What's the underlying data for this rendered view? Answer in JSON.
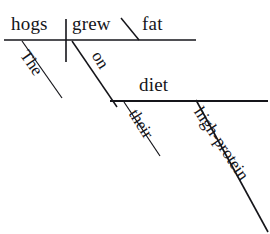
{
  "diagram": {
    "type": "reed-kellogg-sentence-diagram",
    "sentence": "The hogs grew fat on their high-protein diet.",
    "ink_color": "#15151a",
    "canvas": {
      "width": 270,
      "height": 234
    },
    "words": {
      "subject": "hogs",
      "verb": "grew",
      "predicate_adjective": "fat",
      "article": "The",
      "preposition": "on",
      "possessive": "their",
      "adjective": "high-protein",
      "object_of_preposition": "diet"
    },
    "lines": {
      "main_baseline": {
        "x1": 4,
        "y1": 40,
        "x2": 196,
        "y2": 40
      },
      "subject_verb_divider": {
        "x1": 66,
        "y1": 19,
        "x2": 66,
        "y2": 62
      },
      "predicate_adjective_slant": {
        "x1": 121,
        "y1": 18,
        "x2": 139,
        "y2": 40
      },
      "article_slant": {
        "x1": 22,
        "y1": 41,
        "x2": 62,
        "y2": 98
      },
      "preposition_slant": {
        "x1": 72,
        "y1": 41,
        "x2": 117,
        "y2": 107
      },
      "prep_object_baseline": {
        "x1": 110,
        "y1": 101,
        "x2": 268,
        "y2": 101
      },
      "possessive_slant": {
        "x1": 124,
        "y1": 102,
        "x2": 160,
        "y2": 156
      },
      "adjective_slant": {
        "x1": 196,
        "y1": 100,
        "x2": 268,
        "y2": 232
      }
    }
  }
}
